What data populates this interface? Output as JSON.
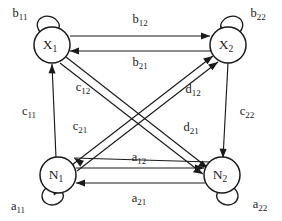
{
  "diagram": {
    "background_color": "#ffffff",
    "stroke_color": "#1a1a1a",
    "nodes": [
      {
        "id": "X1",
        "base": "X",
        "sub": "1",
        "cx": 52,
        "cy": 45,
        "r": 18
      },
      {
        "id": "X2",
        "base": "X",
        "sub": "2",
        "cx": 228,
        "cy": 45,
        "r": 18
      },
      {
        "id": "N1",
        "base": "N",
        "sub": "1",
        "cx": 58,
        "cy": 175,
        "r": 18
      },
      {
        "id": "N2",
        "base": "N",
        "sub": "2",
        "cx": 222,
        "cy": 175,
        "r": 18
      }
    ],
    "self_loops": [
      {
        "id": "loop-b11",
        "node": "X1",
        "base": "b",
        "sub": "11",
        "label_x": 20,
        "label_y": 14
      },
      {
        "id": "loop-b22",
        "node": "X2",
        "base": "b",
        "sub": "22",
        "label_x": 258,
        "label_y": 14
      },
      {
        "id": "loop-a11",
        "node": "N1",
        "base": "a",
        "sub": "11",
        "label_x": 18,
        "label_y": 207
      },
      {
        "id": "loop-a22",
        "node": "N2",
        "base": "a",
        "sub": "22",
        "label_x": 260,
        "label_y": 205
      }
    ],
    "edges": [
      {
        "id": "edge-b12",
        "from": "X1",
        "to": "X2",
        "base": "b",
        "sub": "12",
        "label_x": 140,
        "label_y": 20
      },
      {
        "id": "edge-b21",
        "from": "X2",
        "to": "X1",
        "base": "b",
        "sub": "21",
        "label_x": 140,
        "label_y": 63
      },
      {
        "id": "edge-a12",
        "from": "N1",
        "to": "N2",
        "base": "a",
        "sub": "12",
        "label_x": 139,
        "label_y": 158
      },
      {
        "id": "edge-a21",
        "from": "N2",
        "to": "N1",
        "base": "a",
        "sub": "21",
        "label_x": 139,
        "label_y": 199
      },
      {
        "id": "edge-c11",
        "from": "N1",
        "to": "X1",
        "base": "c",
        "sub": "11",
        "label_x": 29,
        "label_y": 112
      },
      {
        "id": "edge-c22",
        "from": "X2",
        "to": "N2",
        "base": "c",
        "sub": "22",
        "label_x": 247,
        "label_y": 112
      },
      {
        "id": "edge-c12",
        "from": "X1",
        "to": "N2",
        "base": "c",
        "sub": "12",
        "label_x": 83,
        "label_y": 88
      },
      {
        "id": "edge-c21",
        "from": "X1",
        "to": "N2",
        "base": "c",
        "sub": "21",
        "label_x": 80,
        "label_y": 127
      },
      {
        "id": "edge-d12",
        "from": "N1",
        "to": "X2",
        "base": "d",
        "sub": "12",
        "label_x": 193,
        "label_y": 90
      },
      {
        "id": "edge-d21",
        "from": "N1",
        "to": "X2",
        "base": "d",
        "sub": "21",
        "label_x": 191,
        "label_y": 128
      }
    ]
  }
}
